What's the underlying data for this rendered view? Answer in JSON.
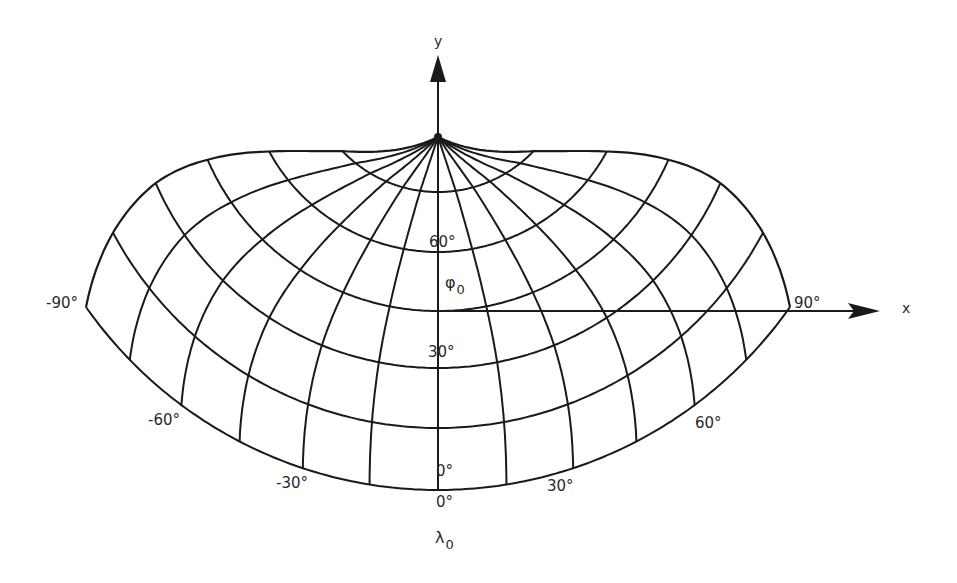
{
  "figure": {
    "type": "map-projection-graticule",
    "axes": {
      "x_label": "x",
      "y_label": "y"
    },
    "standard_parallel_label": {
      "symbol": "φ",
      "subscript": "0"
    },
    "central_meridian_label": {
      "symbol": "λ",
      "subscript": "0"
    },
    "graticule": {
      "meridian_step_deg": 15,
      "parallel_step_deg": 15,
      "lon_range_deg": [
        -90,
        90
      ],
      "lat_range_deg": [
        0,
        90
      ],
      "standard_parallel_deg": 45
    },
    "latitude_labels": [
      {
        "text": "60°",
        "lat": 60
      },
      {
        "text": "30°",
        "lat": 30
      },
      {
        "text": "0°",
        "lat": 0
      }
    ],
    "longitude_labels": [
      {
        "text": "-90°",
        "lon": -90
      },
      {
        "text": "-60°",
        "lon": -60
      },
      {
        "text": "-30°",
        "lon": -30
      },
      {
        "text": "0°",
        "lon": 0
      },
      {
        "text": "30°",
        "lon": 30
      },
      {
        "text": "60°",
        "lon": 60
      },
      {
        "text": "90°",
        "lon": 90
      }
    ],
    "geometry": {
      "apex": [
        438,
        60
      ],
      "parallel_radii": {
        "0": 430,
        "15": 368,
        "30": 308,
        "45": 251,
        "60": 192,
        "75": 132,
        "90": 77
      },
      "equator_half_angle_rad": 0.959,
      "x_axis_y": 311,
      "x_axis_x_range": [
        438,
        880
      ],
      "y_axis_x": 438,
      "y_axis_y_range": [
        137,
        55
      ],
      "line_color": "#1a1a1a"
    }
  }
}
